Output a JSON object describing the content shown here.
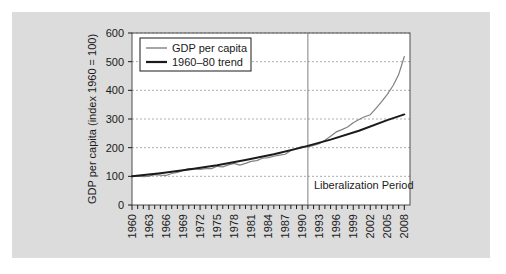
{
  "chart_data": {
    "type": "line",
    "title": "",
    "xlabel": "",
    "ylabel": "GDP per capita (index 1960 = 100)",
    "ylim": [
      0,
      600
    ],
    "xlim": [
      1960,
      2009
    ],
    "yticks": [
      0,
      100,
      200,
      300,
      400,
      500,
      600
    ],
    "ytick_labels": [
      "0",
      "100",
      "200",
      "300",
      "400",
      "500",
      "600"
    ],
    "xtick_labels": [
      "1960",
      "1963",
      "1966",
      "1969",
      "1972",
      "1975",
      "1978",
      "1981",
      "1984",
      "1987",
      "1990",
      "1993",
      "1996",
      "1999",
      "2002",
      "2005",
      "2008"
    ],
    "grid": "horizontal-dashed",
    "legend_position": "top-left",
    "annotations": [
      {
        "text": "Liberalization Period",
        "x": 1991,
        "type": "vertical-line-with-label",
        "label_y": 55
      }
    ],
    "series": [
      {
        "name": "GDP per capita",
        "color": "#808080",
        "x": [
          1960,
          1961,
          1962,
          1963,
          1964,
          1965,
          1966,
          1967,
          1968,
          1969,
          1970,
          1971,
          1972,
          1973,
          1974,
          1975,
          1976,
          1977,
          1978,
          1979,
          1980,
          1981,
          1982,
          1983,
          1984,
          1985,
          1986,
          1987,
          1988,
          1989,
          1990,
          1991,
          1992,
          1993,
          1994,
          1995,
          1996,
          1997,
          1998,
          1999,
          2000,
          2001,
          2002,
          2003,
          2004,
          2005,
          2006,
          2007,
          2008
        ],
        "values": [
          100,
          101,
          99,
          101,
          106,
          104,
          103,
          110,
          114,
          121,
          127,
          126,
          124,
          127,
          127,
          135,
          133,
          140,
          145,
          139,
          145,
          152,
          155,
          163,
          165,
          170,
          174,
          177,
          190,
          197,
          205,
          203,
          208,
          214,
          226,
          240,
          255,
          263,
          272,
          287,
          298,
          308,
          315,
          337,
          361,
          386,
          416,
          455,
          518
        ]
      },
      {
        "name": "1960–80 trend",
        "color": "#1a1a1a",
        "x": [
          1960,
          1965,
          1970,
          1975,
          1980,
          1985,
          1990,
          1995,
          2000,
          2005,
          2008
        ],
        "values": [
          100,
          111,
          124,
          139,
          157,
          177,
          201,
          228,
          259,
          296,
          316
        ]
      }
    ]
  },
  "legend": {
    "items": [
      {
        "label": "GDP per capita",
        "color": "#808080",
        "width": 1.4
      },
      {
        "label": "1960–80 trend",
        "color": "#1a1a1a",
        "width": 2.2
      }
    ]
  }
}
